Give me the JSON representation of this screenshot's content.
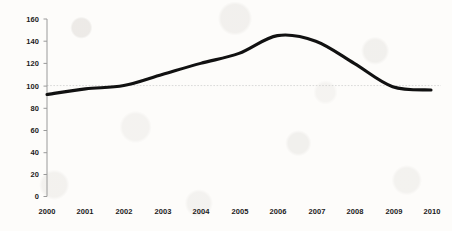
{
  "chart_data": {
    "type": "line",
    "title": "",
    "subtitle": "",
    "xlabel": "",
    "ylabel": "",
    "categories": [
      "2000",
      "2001",
      "2002",
      "2003",
      "2004",
      "2005",
      "2006",
      "2007",
      "2008",
      "2009",
      "2010"
    ],
    "x": [
      2000,
      2001,
      2002,
      2003,
      2004,
      2005,
      2006,
      2007,
      2008,
      2009,
      2010
    ],
    "values": [
      92,
      97,
      100,
      110,
      120,
      129,
      145,
      140,
      120,
      99,
      96
    ],
    "series": [
      {
        "name": "",
        "values": [
          92,
          97,
          100,
          110,
          120,
          129,
          145,
          140,
          120,
          99,
          96
        ]
      }
    ],
    "ylim": [
      0,
      160
    ],
    "yticks": [
      0,
      20,
      40,
      60,
      80,
      100,
      120,
      140,
      160
    ],
    "ytick_labels": [
      "0",
      "20",
      "40",
      "60",
      "80",
      "100",
      "120",
      "140",
      "160"
    ],
    "xtick_labels": [
      "2000",
      "2001",
      "2002",
      "2003",
      "2004",
      "2005",
      "2006",
      "2007",
      "2008",
      "2009",
      "2010"
    ],
    "grid": true,
    "gridlines_y": [
      100
    ],
    "legend": false,
    "legend_position": "none",
    "annotations": [],
    "line_color": "#111111",
    "axis_color": "#9a9a9a",
    "gridline_color": "#c9c9c9",
    "background_color": "#fdfcfa",
    "peak_year": "2006",
    "peak_value": 145
  },
  "axes": {
    "y_axis_name": "value-axis",
    "x_axis_name": "year-axis"
  }
}
